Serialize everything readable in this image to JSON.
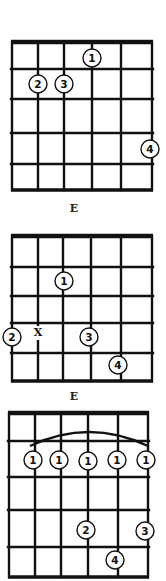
{
  "diagrams": [
    {
      "label": "E",
      "strings_x": [
        12,
        38,
        64,
        92,
        121,
        152
      ],
      "frets_y": [
        42,
        69,
        99,
        133,
        164,
        190
      ],
      "label_pos": [
        74,
        212
      ],
      "dots": [
        {
          "finger": "1",
          "x": 92,
          "y": 58
        },
        {
          "finger": "2",
          "x": 38,
          "y": 84
        },
        {
          "finger": "3",
          "x": 64,
          "y": 84
        },
        {
          "finger": "4",
          "x": 150,
          "y": 149
        }
      ],
      "marks": []
    },
    {
      "label": "E",
      "strings_x": [
        12,
        38,
        63,
        91,
        121,
        152
      ],
      "frets_y": [
        236,
        267,
        296,
        323,
        353,
        381
      ],
      "label_pos": [
        74,
        400
      ],
      "dots": [
        {
          "finger": "1",
          "x": 64,
          "y": 281
        },
        {
          "finger": "2",
          "x": 12,
          "y": 337
        },
        {
          "finger": "3",
          "x": 89,
          "y": 337
        },
        {
          "finger": "4",
          "x": 118,
          "y": 365
        }
      ],
      "marks": [
        {
          "text": "X",
          "x": 38,
          "y": 336
        }
      ]
    },
    {
      "label": "",
      "strings_x": [
        9,
        35,
        61,
        88,
        118,
        148
      ],
      "frets_y": [
        413,
        441,
        477,
        510,
        547,
        577
      ],
      "label_pos": [
        0,
        0
      ],
      "barre": {
        "from_x": 30,
        "to_x": 148,
        "y": 446,
        "peak_y": 432
      },
      "dots": [
        {
          "finger": "1",
          "x": 33,
          "y": 460
        },
        {
          "finger": "1",
          "x": 59,
          "y": 460
        },
        {
          "finger": "1",
          "x": 88,
          "y": 461
        },
        {
          "finger": "1",
          "x": 117,
          "y": 460
        },
        {
          "finger": "1",
          "x": 146,
          "y": 460
        },
        {
          "finger": "2",
          "x": 86,
          "y": 530
        },
        {
          "finger": "3",
          "x": 145,
          "y": 531
        },
        {
          "finger": "4",
          "x": 115,
          "y": 560
        }
      ],
      "marks": []
    }
  ]
}
